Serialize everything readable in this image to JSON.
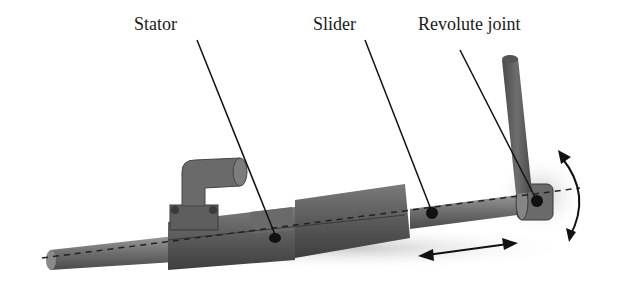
{
  "diagram": {
    "labels": {
      "stator": "Stator",
      "slider": "Slider",
      "revolute_joint": "Revolute joint"
    },
    "colors": {
      "body": "#5a5a5a",
      "body_light": "#7a7a7a",
      "body_dark": "#3a3a3a",
      "line": "#111111",
      "background": "#ffffff"
    }
  }
}
